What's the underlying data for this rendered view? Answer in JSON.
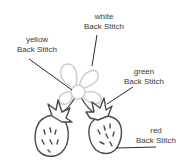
{
  "labels": {
    "white": {
      "color": "white",
      "stitch": "Back Stitch"
    },
    "yellow": {
      "color": "yellow",
      "stitch": "Back Stitch"
    },
    "green": {
      "color": "green",
      "stitch": "Back Stitch"
    },
    "red": {
      "color": "red",
      "stitch": "Back Stitch"
    }
  },
  "colors": {
    "outline": "#4a4a4a",
    "flower_outline": "#cfcfcf",
    "leader_line": "#2a2a2a",
    "label_text": "#3a3a3a"
  }
}
